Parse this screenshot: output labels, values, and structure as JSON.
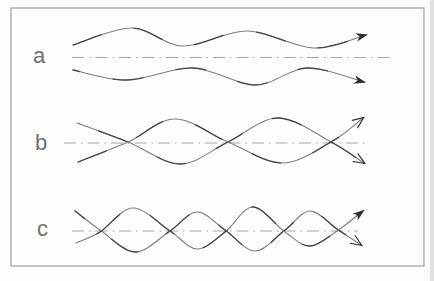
{
  "figure": {
    "colors": {
      "background": "#fdfdfc",
      "border": "#9e9e9e",
      "axis": "#a6a6a6",
      "stroke_light": "#7d7d7d",
      "stroke_dark": "#2e2e2e",
      "label": "#6f6f6f",
      "page_edge": "#d6d6d6"
    },
    "rows": [
      {
        "label": "a",
        "axis": {
          "y": 57.5,
          "x1": 72,
          "x2": 393
        },
        "waves": [
          {
            "arrow": "filled",
            "points": [
              [
                73,
                45
              ],
              [
                132,
                28
              ],
              [
                183,
                46
              ],
              [
                247,
                31
              ],
              [
                313,
                48
              ],
              [
                366,
                35
              ]
            ]
          },
          {
            "arrow": "filled",
            "points": [
              [
                73,
                70
              ],
              [
                127,
                80
              ],
              [
                193,
                68
              ],
              [
                255,
                85
              ],
              [
                307,
                68
              ],
              [
                364,
                82
              ]
            ]
          }
        ]
      },
      {
        "label": "b",
        "axis": {
          "y": 143,
          "x1": 64,
          "x2": 368
        },
        "waves": [
          {
            "arrow": "open",
            "points": [
              [
                77,
                123
              ],
              [
                128,
                142
              ],
              [
                180,
                164
              ],
              [
                228,
                142
              ],
              [
                278,
                118
              ],
              [
                331,
                142
              ],
              [
                364,
                163
              ]
            ]
          },
          {
            "arrow": "open",
            "points": [
              [
                78,
                162
              ],
              [
                128,
                142
              ],
              [
                175,
                119
              ],
              [
                228,
                142
              ],
              [
                282,
                163
              ],
              [
                331,
                142
              ],
              [
                363,
                118
              ]
            ]
          }
        ]
      },
      {
        "label": "c",
        "axis": {
          "y": 231,
          "x1": 72,
          "x2": 358
        },
        "waves": [
          {
            "arrow": "open",
            "points": [
              [
                75,
                211
              ],
              [
                100,
                230
              ],
              [
                135,
                252
              ],
              [
                170,
                231
              ],
              [
                197,
                212
              ],
              [
                225,
                230
              ],
              [
                255,
                251
              ],
              [
                285,
                230
              ],
              [
                310,
                211
              ],
              [
                337,
                229
              ],
              [
                361,
                245
              ]
            ]
          },
          {
            "arrow": "filled",
            "points": [
              [
                76,
                243
              ],
              [
                100,
                232
              ],
              [
                133,
                208
              ],
              [
                170,
                231
              ],
              [
                197,
                249
              ],
              [
                225,
                232
              ],
              [
                253,
                207
              ],
              [
                285,
                232
              ],
              [
                310,
                246
              ],
              [
                337,
                231
              ],
              [
                363,
                211
              ]
            ]
          }
        ]
      }
    ]
  }
}
